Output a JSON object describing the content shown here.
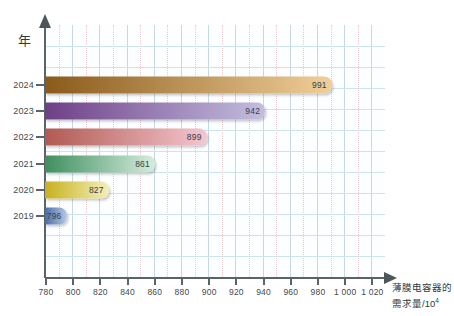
{
  "chart_data": {
    "type": "bar",
    "orientation": "horizontal",
    "title": "",
    "xlabel": "薄膜电容器的需求量/10",
    "xlabel_exponent": "4",
    "ylabel": "年",
    "categories": [
      "2024",
      "2023",
      "2022",
      "2021",
      "2020",
      "2019"
    ],
    "values": [
      991,
      942,
      899,
      861,
      827,
      796
    ],
    "value_labels": [
      "991",
      "942",
      "899",
      "861",
      "827",
      "796"
    ],
    "xlim": [
      780,
      1030
    ],
    "xticks": [
      780,
      800,
      820,
      840,
      860,
      880,
      900,
      920,
      940,
      960,
      980,
      1000,
      1020
    ],
    "xtick_labels": [
      "780",
      "800",
      "820",
      "840",
      "860",
      "880",
      "900",
      "920",
      "940",
      "960",
      "980",
      "1 000",
      "1 020"
    ],
    "grid": true,
    "legend": false,
    "series": [
      {
        "name": "薄膜电容器的需求量",
        "points": [
          {
            "year": "2024",
            "value": 991,
            "color_start": "#8a5a1a",
            "color_end": "#f0cf9a"
          },
          {
            "year": "2023",
            "value": 942,
            "color_start": "#6e3f86",
            "color_end": "#c3bedf"
          },
          {
            "year": "2022",
            "value": 899,
            "color_start": "#b15a52",
            "color_end": "#f4c6cf"
          },
          {
            "year": "2021",
            "value": 861,
            "color_start": "#3f8f5e",
            "color_end": "#d6ecdc"
          },
          {
            "year": "2020",
            "value": 827,
            "color_start": "#c8b11e",
            "color_end": "#f2efb9"
          },
          {
            "year": "2019",
            "value": 796,
            "color_start": "#4a6ea8",
            "color_end": "#b8c7e2"
          }
        ]
      }
    ]
  },
  "axis_style": {
    "axis_color": "#5a6468",
    "major_grid_color": "#c7d8e2",
    "minor_grid_color": "#e8c9cd",
    "horizontal_grid_color": "#cfe3ec",
    "plot_background": "#fdfeff"
  }
}
